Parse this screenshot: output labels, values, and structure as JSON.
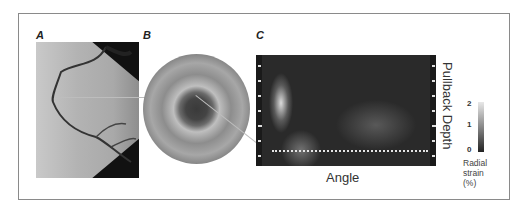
{
  "figure": {
    "panels": [
      {
        "id": "A",
        "label": "A",
        "content": "coronary angiogram"
      },
      {
        "id": "B",
        "label": "B",
        "content": "IVUS cross-section"
      },
      {
        "id": "C",
        "label": "C",
        "content": "radial strain map"
      }
    ],
    "strain_map": {
      "x_axis_label": "Angle",
      "y_axis_label": "Pullback Depth"
    },
    "colorbar": {
      "ticks": [
        "2",
        "1",
        "0"
      ],
      "label_lines": [
        "Radial",
        "strain",
        "(%)"
      ]
    }
  }
}
